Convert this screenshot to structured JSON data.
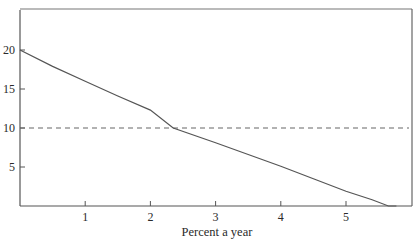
{
  "chart_data": {
    "type": "line",
    "title": "",
    "xlabel": "Percent a year",
    "ylabel": "",
    "xlim": [
      0,
      6.05
    ],
    "ylim": [
      0,
      25
    ],
    "x_ticks": [
      1,
      2,
      3,
      4,
      5
    ],
    "y_ticks": [
      5,
      10,
      15,
      20
    ],
    "grid": false,
    "legend": null,
    "series": [
      {
        "name": "declining curve",
        "style": "solid",
        "color": "#555555",
        "x": [
          0,
          0.5,
          1,
          1.5,
          2,
          2.35,
          2.5,
          3,
          3.5,
          4,
          4.5,
          5,
          5.4,
          5.65
        ],
        "y": [
          20,
          17.9,
          16.0,
          14.1,
          12.3,
          10.0,
          10.0,
          8.1,
          6.6,
          5.1,
          3.5,
          1.9,
          0.8,
          0
        ]
      },
      {
        "name": "reference level",
        "style": "dashed",
        "color": "#555555",
        "x": [
          0,
          6.05
        ],
        "y": [
          10,
          10
        ]
      }
    ],
    "annotations": []
  }
}
